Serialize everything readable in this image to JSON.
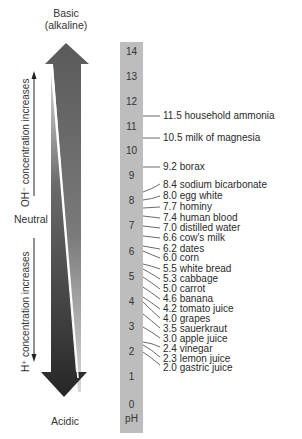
{
  "diagram": {
    "top_label_line1": "Basic",
    "top_label_line2": "(alkaline)",
    "bottom_label": "Acidic",
    "neutral_label": "Neutral",
    "oh_label": "OH⁻ concentration increases",
    "h_label": "H⁺ concentration increases",
    "scale_unit": "pH",
    "colors": {
      "basic_arrow": "#5c5c5c",
      "acidic_arrow": "#2f2f2f",
      "scale_bar": "#bdbdbd",
      "text": "#2a2a2a"
    }
  },
  "scale": {
    "ticks": [
      "14",
      "13",
      "12",
      "11",
      "10",
      "9",
      "8",
      "7",
      "6",
      "5",
      "4",
      "3",
      "2",
      "1",
      "0"
    ]
  },
  "substances": [
    {
      "ph": "11.5",
      "name": "household ammonia",
      "text": "11.5 household ammonia"
    },
    {
      "ph": "10.5",
      "name": "milk of magnesia",
      "text": "10.5 milk of magnesia"
    },
    {
      "ph": "9.2",
      "name": "borax",
      "text": "9.2 borax"
    },
    {
      "ph": "8.4",
      "name": "sodium bicarbonate",
      "text": "8.4 sodium bicarbonate"
    },
    {
      "ph": "8.0",
      "name": "egg white",
      "text": "8.0 egg white"
    },
    {
      "ph": "7.7",
      "name": "hominy",
      "text": "7.7 hominy"
    },
    {
      "ph": "7.4",
      "name": "human blood",
      "text": "7.4 human blood"
    },
    {
      "ph": "7.0",
      "name": "distilled water",
      "text": "7.0 distilled water"
    },
    {
      "ph": "6.6",
      "name": "cow's milk",
      "text": "6.6 cow's milk"
    },
    {
      "ph": "6.2",
      "name": "dates",
      "text": "6.2 dates"
    },
    {
      "ph": "6.0",
      "name": "corn",
      "text": "6.0 corn"
    },
    {
      "ph": "5.5",
      "name": "white bread",
      "text": "5.5 white bread"
    },
    {
      "ph": "5.3",
      "name": "cabbage",
      "text": "5.3 cabbage"
    },
    {
      "ph": "5.0",
      "name": "carrot",
      "text": "5.0 carrot"
    },
    {
      "ph": "4.6",
      "name": "banana",
      "text": "4.6 banana"
    },
    {
      "ph": "4.2",
      "name": "tomato juice",
      "text": "4.2 tomato juice"
    },
    {
      "ph": "4.0",
      "name": "grapes",
      "text": "4.0 grapes"
    },
    {
      "ph": "3.5",
      "name": "sauerkraut",
      "text": "3.5 sauerkraut"
    },
    {
      "ph": "3.0",
      "name": "apple juice",
      "text": "3.0 apple juice"
    },
    {
      "ph": "2.4",
      "name": "vinegar",
      "text": "2.4 vinegar"
    },
    {
      "ph": "2.3",
      "name": "lemon juice",
      "text": "2.3 lemon juice"
    },
    {
      "ph": "2.0",
      "name": "gastric juice",
      "text": "2.0 gastric juice"
    }
  ]
}
